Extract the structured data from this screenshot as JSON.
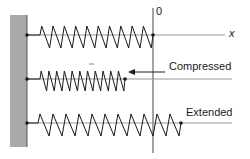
{
  "diagram": {
    "colors": {
      "wall": "#a9a9a9",
      "line": "#1a1a1a",
      "baseline": "#8a8a8a",
      "background": "#ffffff"
    },
    "axis": {
      "origin_label": "0",
      "x_label": "x"
    },
    "springs": [
      {
        "name": "equilibrium",
        "label": "",
        "y": 35,
        "start_x": 40,
        "end_x": 153,
        "coils": 10,
        "amp": 11
      },
      {
        "name": "compressed",
        "label": "Compressed",
        "y": 79,
        "start_x": 40,
        "end_x": 125,
        "coils": 11,
        "amp": 10
      },
      {
        "name": "extended",
        "label": "Extended",
        "y": 123,
        "start_x": 38,
        "end_x": 181,
        "coils": 11,
        "amp": 11
      }
    ],
    "labels": {
      "compressed": "Compressed",
      "extended": "Extended"
    }
  }
}
